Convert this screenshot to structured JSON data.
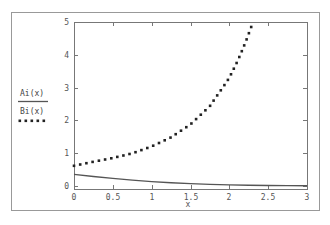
{
  "chart_data": {
    "type": "line",
    "title": "",
    "xlabel": "x",
    "ylabel": "",
    "xlim": [
      0,
      3
    ],
    "ylim": [
      -0.1,
      5
    ],
    "xticks": [
      0,
      0.5,
      1,
      1.5,
      2,
      2.5,
      3
    ],
    "xtick_labels": [
      "0",
      "0.5",
      "1",
      "1.5",
      "2",
      "2.5",
      "3"
    ],
    "yticks": [
      0,
      1,
      2,
      3,
      4,
      5
    ],
    "ytick_labels": [
      "0",
      "1",
      "2",
      "3",
      "4",
      "5"
    ],
    "grid": false,
    "legend_position": "left",
    "series": [
      {
        "name": "Ai(x)",
        "style": "solid",
        "color": "#555555",
        "x": [
          0,
          0.25,
          0.5,
          0.75,
          1,
          1.25,
          1.5,
          1.75,
          2,
          2.25,
          2.5,
          2.75,
          3
        ],
        "values": [
          0.355,
          0.29,
          0.231,
          0.179,
          0.135,
          0.1,
          0.072,
          0.05,
          0.035,
          0.024,
          0.016,
          0.011,
          0.007
        ]
      },
      {
        "name": "Bi(x)",
        "style": "dotted",
        "color": "#222222",
        "x": [
          0,
          0.25,
          0.5,
          0.75,
          1,
          1.25,
          1.5,
          1.75,
          2,
          2.1,
          2.2,
          2.3
        ],
        "values": [
          0.615,
          0.739,
          0.854,
          0.996,
          1.207,
          1.484,
          1.879,
          2.437,
          3.298,
          3.78,
          4.33,
          4.96
        ]
      }
    ]
  },
  "legend": {
    "items": [
      {
        "label": "Ai(x)",
        "style": "solid"
      },
      {
        "label": "Bi(x)",
        "style": "dotted"
      }
    ]
  },
  "axes": {
    "xlabel": "x"
  },
  "colors": {
    "frame": "#888888",
    "axis": "#777777",
    "text": "#555555"
  }
}
